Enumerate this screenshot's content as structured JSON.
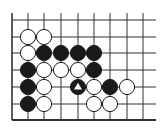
{
  "diagram": {
    "type": "go-board-fragment",
    "background": "#ffffff",
    "line_color": "#333333",
    "edges": {
      "left": true,
      "bottom": true,
      "top": false,
      "right": false
    },
    "columns_x": [
      12,
      28,
      44,
      61,
      78,
      94,
      110,
      127,
      143
    ],
    "rows_y": [
      20,
      37,
      53,
      70,
      87,
      104,
      120
    ],
    "line_extent": {
      "top": 13,
      "right": 156
    },
    "stone_radius": 7.6,
    "stones": [
      {
        "color": "white",
        "col": 2,
        "row": 2
      },
      {
        "color": "white",
        "col": 3,
        "row": 2
      },
      {
        "color": "white",
        "col": 2,
        "row": 3
      },
      {
        "color": "black",
        "col": 3,
        "row": 3
      },
      {
        "color": "black",
        "col": 4,
        "row": 3
      },
      {
        "color": "black",
        "col": 5,
        "row": 3
      },
      {
        "color": "black",
        "col": 6,
        "row": 3
      },
      {
        "color": "black",
        "col": 2,
        "row": 4
      },
      {
        "color": "white",
        "col": 3,
        "row": 4
      },
      {
        "color": "white",
        "col": 4,
        "row": 4
      },
      {
        "color": "white",
        "col": 5,
        "row": 4
      },
      {
        "color": "black",
        "col": 6,
        "row": 4
      },
      {
        "color": "black",
        "col": 2,
        "row": 5
      },
      {
        "color": "white",
        "col": 3,
        "row": 5
      },
      {
        "color": "black",
        "col": 5,
        "row": 5,
        "marker": "triangle"
      },
      {
        "color": "white",
        "col": 6,
        "row": 5
      },
      {
        "color": "black",
        "col": 7,
        "row": 5
      },
      {
        "color": "white",
        "col": 8,
        "row": 5
      },
      {
        "color": "black",
        "col": 2,
        "row": 6
      },
      {
        "color": "white",
        "col": 3,
        "row": 6
      },
      {
        "color": "white",
        "col": 6,
        "row": 6
      },
      {
        "color": "white",
        "col": 7,
        "row": 6
      }
    ]
  }
}
